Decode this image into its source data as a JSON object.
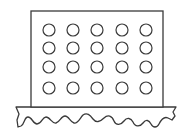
{
  "figure": {
    "colors": {
      "stroke": "#3a3a3a",
      "background": "#ffffff",
      "fill": "#ffffff"
    },
    "board": {
      "x": 31,
      "y": 11,
      "width": 132,
      "height": 96
    },
    "grid": {
      "columns": 5,
      "rows": 4,
      "column_centers": [
        49,
        73,
        97,
        122,
        146
      ],
      "row_centers": [
        30,
        48,
        67,
        88
      ],
      "radius": 6
    },
    "base": {
      "top_y": 107,
      "left_x": 16,
      "right_x": 176
    }
  }
}
